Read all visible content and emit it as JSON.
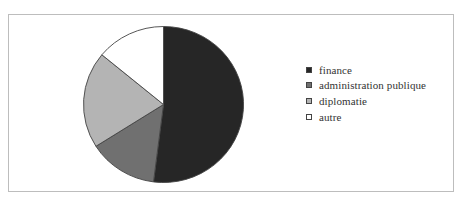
{
  "chart_data": {
    "type": "pie",
    "title": "",
    "categories": [
      "finance",
      "administration publique",
      "diplomatie",
      "autre"
    ],
    "values": [
      52,
      14,
      20,
      14
    ],
    "unit": "%",
    "colors": [
      "#262626",
      "#707070",
      "#b4b4b4",
      "#ffffff"
    ],
    "start_angle_deg": 0,
    "direction": "clockwise",
    "legend_position": "right"
  },
  "legend": {
    "items": [
      {
        "label": "finance",
        "color": "#262626"
      },
      {
        "label": "administration publique",
        "color": "#707070"
      },
      {
        "label": "diplomatie",
        "color": "#b4b4b4"
      },
      {
        "label": "autre",
        "color": "#ffffff"
      }
    ]
  }
}
